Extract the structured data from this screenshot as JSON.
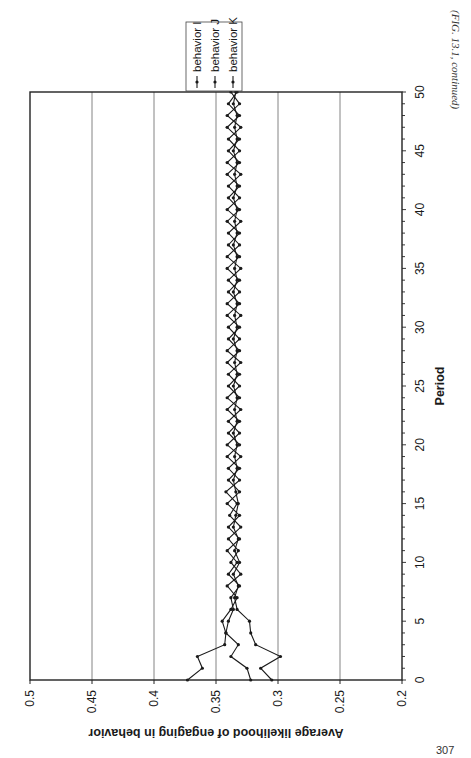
{
  "caption": "(FIG. 13.1, continued)",
  "page_number": "307",
  "chart_data": {
    "type": "line",
    "orientation": "rotated-90-clockwise",
    "title": "",
    "xlabel": "Period",
    "ylabel": "Average likelihood of engaging in behavior",
    "xlim": [
      0,
      50
    ],
    "ylim": [
      0.2,
      0.5
    ],
    "x_ticks": [
      "0",
      "5",
      "10",
      "15",
      "20",
      "25",
      "30",
      "35",
      "40",
      "45",
      "50"
    ],
    "y_ticks": [
      "0.2",
      "0.25",
      "0.3",
      "0.35",
      "0.4",
      "0.45",
      "0.5"
    ],
    "grid": "horizontal major gridlines at 0.25, 0.3, 0.35, 0.4, 0.45",
    "legend_position": "top-right (rotated)",
    "legend": [
      "behavior I",
      "behavior J",
      "behavior K"
    ],
    "x": [
      0,
      1,
      2,
      3,
      4,
      5,
      6,
      7,
      8,
      9,
      10,
      11,
      12,
      13,
      14,
      15,
      16,
      17,
      18,
      19,
      20,
      21,
      22,
      23,
      24,
      25,
      26,
      27,
      28,
      29,
      30,
      31,
      32,
      33,
      34,
      35,
      36,
      37,
      38,
      39,
      40,
      41,
      42,
      43,
      44,
      45,
      46,
      47,
      48,
      49,
      50
    ],
    "series": [
      {
        "name": "behavior I",
        "values": [
          0.373,
          0.361,
          0.365,
          0.343,
          0.342,
          0.345,
          0.338,
          0.333,
          0.341,
          0.33,
          0.338,
          0.332,
          0.34,
          0.33,
          0.339,
          0.333,
          0.342,
          0.331,
          0.34,
          0.33,
          0.341,
          0.331,
          0.34,
          0.33,
          0.341,
          0.331,
          0.34,
          0.33,
          0.341,
          0.331,
          0.34,
          0.33,
          0.341,
          0.331,
          0.34,
          0.33,
          0.341,
          0.331,
          0.34,
          0.33,
          0.341,
          0.331,
          0.34,
          0.33,
          0.341,
          0.331,
          0.34,
          0.33,
          0.341,
          0.331,
          0.338
        ]
      },
      {
        "name": "behavior J",
        "values": [
          0.322,
          0.325,
          0.338,
          0.332,
          0.342,
          0.34,
          0.336,
          0.338,
          0.331,
          0.34,
          0.333,
          0.341,
          0.331,
          0.34,
          0.331,
          0.341,
          0.331,
          0.34,
          0.331,
          0.341,
          0.331,
          0.34,
          0.331,
          0.341,
          0.331,
          0.34,
          0.331,
          0.341,
          0.331,
          0.34,
          0.331,
          0.341,
          0.331,
          0.34,
          0.331,
          0.341,
          0.331,
          0.34,
          0.331,
          0.341,
          0.331,
          0.34,
          0.331,
          0.341,
          0.331,
          0.34,
          0.331,
          0.341,
          0.331,
          0.34,
          0.333
        ]
      },
      {
        "name": "behavior K",
        "values": [
          0.305,
          0.314,
          0.298,
          0.318,
          0.322,
          0.323,
          0.333,
          0.335,
          0.332,
          0.336,
          0.331,
          0.335,
          0.332,
          0.336,
          0.334,
          0.332,
          0.334,
          0.336,
          0.333,
          0.335,
          0.333,
          0.336,
          0.333,
          0.335,
          0.333,
          0.336,
          0.333,
          0.335,
          0.333,
          0.336,
          0.333,
          0.335,
          0.333,
          0.336,
          0.333,
          0.335,
          0.333,
          0.336,
          0.333,
          0.335,
          0.333,
          0.336,
          0.333,
          0.335,
          0.333,
          0.336,
          0.333,
          0.335,
          0.333,
          0.336,
          0.334
        ]
      }
    ]
  }
}
